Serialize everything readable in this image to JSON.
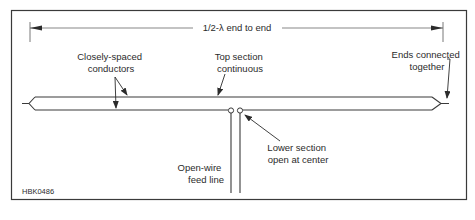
{
  "figure_id": "HBK0486",
  "dimension": {
    "label": "1/2-λ end to end"
  },
  "labels": {
    "closely_spaced_1": "Closely-spaced",
    "closely_spaced_2": "conductors",
    "top_section_1": "Top section",
    "top_section_2": "continuous",
    "ends_connected_1": "Ends connected",
    "ends_connected_2": "together",
    "feed_line_1": "Open-wire",
    "feed_line_2": "feed line",
    "lower_section_1": "Lower section",
    "lower_section_2": "open at center"
  },
  "colors": {
    "line": "#3a3a3a",
    "border": "#3a3a3a",
    "text": "#2b2b2b"
  }
}
